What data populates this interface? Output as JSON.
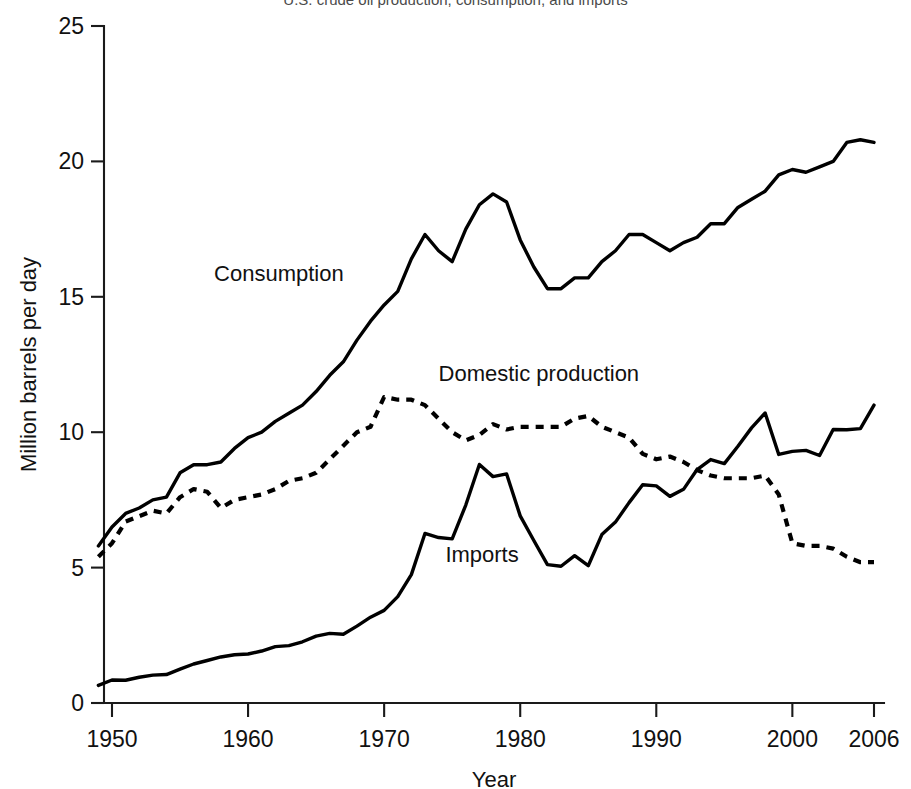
{
  "chart_data": {
    "type": "line",
    "title": "U.S. crude oil production, consumption, and imports",
    "xlabel": "Year",
    "ylabel": "Million barrels per day",
    "xlim": [
      1949,
      2006
    ],
    "ylim": [
      0,
      25
    ],
    "grid": false,
    "legend_position": "inline-annotations",
    "xticks": [
      "1950",
      "1960",
      "1970",
      "1980",
      "1990",
      "2000",
      "2006"
    ],
    "xtick_values": [
      1950,
      1960,
      1970,
      1980,
      1990,
      2000,
      2006
    ],
    "yticks": [
      "0",
      "5",
      "10",
      "15",
      "20",
      "25"
    ],
    "ytick_values": [
      0,
      5,
      10,
      15,
      20,
      25
    ],
    "x": [
      1949,
      1950,
      1951,
      1952,
      1953,
      1954,
      1955,
      1956,
      1957,
      1958,
      1959,
      1960,
      1961,
      1962,
      1963,
      1964,
      1965,
      1966,
      1967,
      1968,
      1969,
      1970,
      1971,
      1972,
      1973,
      1974,
      1975,
      1976,
      1977,
      1978,
      1979,
      1980,
      1981,
      1982,
      1983,
      1984,
      1985,
      1986,
      1987,
      1988,
      1989,
      1990,
      1991,
      1992,
      1993,
      1994,
      1995,
      1996,
      1997,
      1998,
      1999,
      2000,
      2001,
      2002,
      2003,
      2004,
      2005,
      2006
    ],
    "series": [
      {
        "name": "Consumption",
        "style": "solid",
        "label_x": 1957.5,
        "label_y": 15.6,
        "values": [
          5.8,
          6.5,
          7.0,
          7.2,
          7.5,
          7.6,
          8.5,
          8.8,
          8.8,
          8.9,
          9.4,
          9.8,
          10.0,
          10.4,
          10.7,
          11.0,
          11.5,
          12.1,
          12.6,
          13.4,
          14.1,
          14.7,
          15.2,
          16.4,
          17.3,
          16.7,
          16.3,
          17.5,
          18.4,
          18.8,
          18.5,
          17.1,
          16.1,
          15.3,
          15.3,
          15.7,
          15.7,
          16.3,
          16.7,
          17.3,
          17.3,
          17.0,
          16.7,
          17.0,
          17.2,
          17.7,
          17.7,
          18.3,
          18.6,
          18.9,
          19.5,
          19.7,
          19.6,
          19.8,
          20.0,
          20.7,
          20.8,
          20.7
        ]
      },
      {
        "name": "Domestic production",
        "style": "dotted",
        "label_x": 1974.0,
        "label_y": 11.9,
        "values": [
          5.4,
          5.9,
          6.7,
          6.9,
          7.1,
          7.0,
          7.6,
          7.9,
          7.8,
          7.2,
          7.5,
          7.6,
          7.7,
          7.9,
          8.2,
          8.3,
          8.5,
          9.0,
          9.5,
          10.0,
          10.2,
          11.3,
          11.2,
          11.2,
          11.0,
          10.5,
          10.0,
          9.7,
          9.9,
          10.3,
          10.1,
          10.2,
          10.2,
          10.2,
          10.2,
          10.5,
          10.6,
          10.2,
          10.0,
          9.8,
          9.2,
          9.0,
          9.1,
          8.9,
          8.6,
          8.4,
          8.3,
          8.3,
          8.3,
          8.4,
          7.7,
          5.9,
          5.8,
          5.8,
          5.7,
          5.4,
          5.2,
          5.2
        ]
      },
      {
        "name": "Imports",
        "style": "solid",
        "label_x": 1974.5,
        "label_y": 5.2,
        "values": [
          0.65,
          0.85,
          0.84,
          0.95,
          1.03,
          1.05,
          1.25,
          1.44,
          1.57,
          1.7,
          1.78,
          1.81,
          1.92,
          2.08,
          2.12,
          2.26,
          2.47,
          2.57,
          2.54,
          2.84,
          3.17,
          3.42,
          3.93,
          4.74,
          6.26,
          6.11,
          6.06,
          7.31,
          8.81,
          8.36,
          8.46,
          6.91,
          6.0,
          5.11,
          5.05,
          5.44,
          5.07,
          6.22,
          6.68,
          7.4,
          8.06,
          8.02,
          7.63,
          7.89,
          8.62,
          8.99,
          8.84,
          9.48,
          10.16,
          10.71,
          9.18,
          9.29,
          9.33,
          9.14,
          10.1,
          10.09,
          10.13,
          11.0
        ]
      }
    ]
  },
  "axis": {
    "y_title": "Million barrels per day",
    "x_title": "Year"
  }
}
